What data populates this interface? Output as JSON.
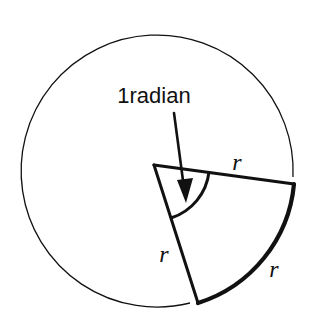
{
  "diagram": {
    "title_label": "1radian",
    "side_labels": {
      "top_radius": "r",
      "left_radius": "r",
      "arc_length": "r"
    },
    "colors": {
      "stroke": "#111111",
      "background": "#ffffff"
    }
  }
}
